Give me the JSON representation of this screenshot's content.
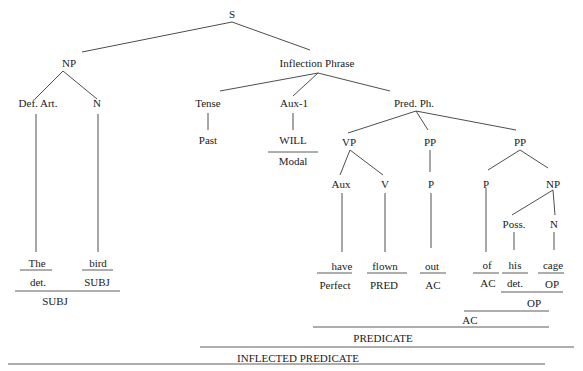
{
  "diagram": {
    "type": "syntax-tree",
    "root": "S",
    "nodes": {
      "s": "S",
      "np_subj": "NP",
      "def_art": "Def. Art.",
      "n_subj": "N",
      "infl_phrase": "Inflection Phrase",
      "tense": "Tense",
      "past": "Past",
      "aux1": "Aux-1",
      "will": "WILL",
      "modal": "Modal",
      "pred_ph": "Pred. Ph.",
      "vp": "VP",
      "pp1": "PP",
      "pp2": "PP",
      "aux": "Aux",
      "v": "V",
      "p1": "P",
      "p2": "P",
      "np_obj": "NP",
      "poss": "Poss.",
      "n_obj": "N"
    },
    "words": [
      {
        "word": "The",
        "function": "det."
      },
      {
        "word": "bird",
        "function": "SUBJ"
      },
      {
        "word": "have",
        "function": "Perfect"
      },
      {
        "word": "flown",
        "function": "PRED"
      },
      {
        "word": "out",
        "function": "AC"
      },
      {
        "word": "of",
        "function": "AC"
      },
      {
        "word": "his",
        "function": "det."
      },
      {
        "word": "cage",
        "function": "OP"
      }
    ],
    "group_labels": {
      "subj_group": "SUBJ",
      "op_group": "OP",
      "ac_group": "AC",
      "predicate": "PREDICATE",
      "inflected_predicate": "INFLECTED PREDICATE"
    }
  }
}
